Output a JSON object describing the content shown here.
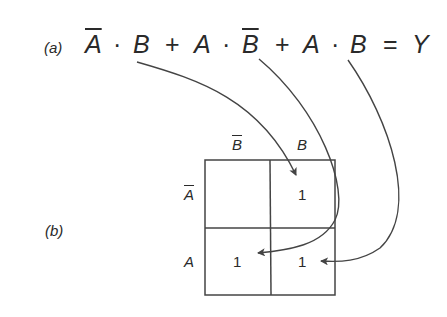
{
  "part_a": {
    "label": "(a)",
    "terms": [
      {
        "var1": "A",
        "var1_bar": true,
        "dot": "·",
        "var2": "B",
        "var2_bar": false
      },
      {
        "var1": "A",
        "var1_bar": false,
        "dot": "·",
        "var2": "B",
        "var2_bar": true
      },
      {
        "var1": "A",
        "var1_bar": false,
        "dot": "·",
        "var2": "B",
        "var2_bar": false
      }
    ],
    "plus": "+",
    "equals": "=",
    "output": "Y"
  },
  "part_b": {
    "label": "(b)",
    "col_headers": [
      "B",
      "B"
    ],
    "col_header_bars": [
      true,
      false
    ],
    "row_headers": [
      "A",
      "A"
    ],
    "row_header_bars": [
      true,
      false
    ],
    "cells": [
      [
        "",
        "1"
      ],
      [
        "1",
        "1"
      ]
    ]
  },
  "colors": {
    "ink": "#2a2a2a",
    "arrow": "#444444"
  }
}
